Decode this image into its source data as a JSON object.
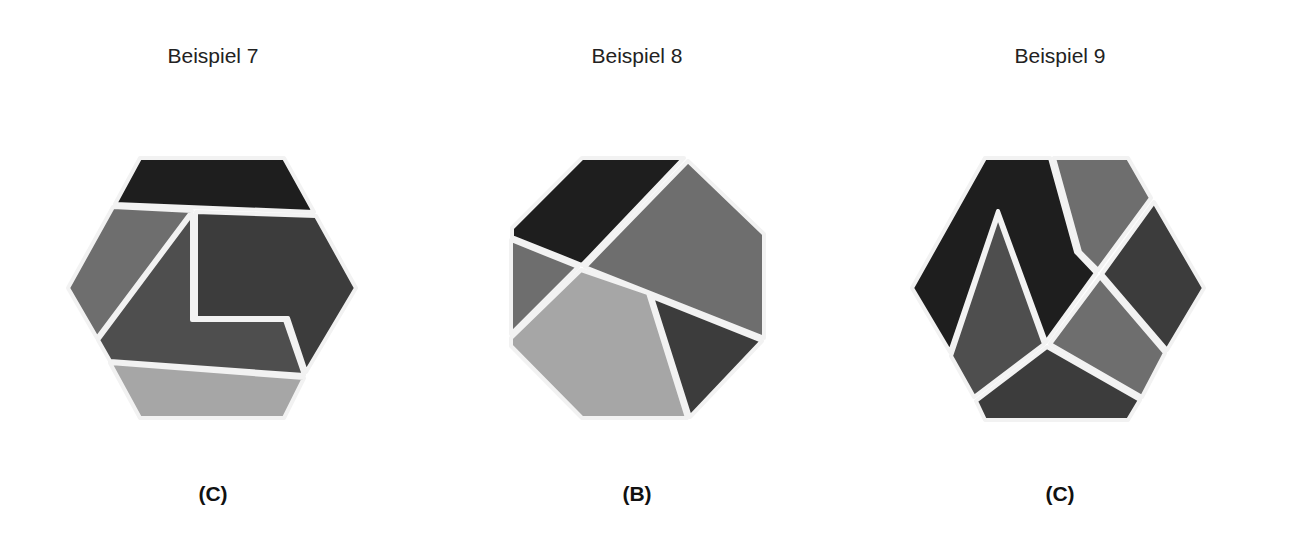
{
  "examples": [
    {
      "title": "Beispiel 7",
      "answer": "(C)",
      "shape": "hexagon",
      "pieces": 5
    },
    {
      "title": "Beispiel 8",
      "answer": "(B)",
      "shape": "octagon",
      "pieces": 5
    },
    {
      "title": "Beispiel 9",
      "answer": "(C)",
      "shape": "hexagon",
      "pieces": 6
    }
  ],
  "colors": {
    "black": "#1e1e1e",
    "dark": "#3c3c3c",
    "mid_dark": "#4e4e4e",
    "mid": "#6e6e6e",
    "light": "#a6a6a6",
    "separator": "#f2f2f2"
  }
}
